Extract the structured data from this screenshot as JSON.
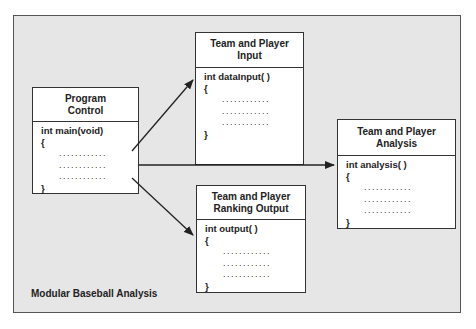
{
  "diagram": {
    "caption": "Modular Baseball Analysis",
    "boxes": {
      "control": {
        "title_line1": "Program",
        "title_line2": "Control",
        "signature": "int main(void)",
        "open_brace": "{",
        "dots": [
          "............",
          "............",
          "............"
        ],
        "close_brace": "}"
      },
      "input": {
        "title_line1": "Team and Player",
        "title_line2": "Input",
        "signature": "int dataInput( )",
        "open_brace": "{",
        "dots": [
          "............",
          "............",
          "............"
        ],
        "close_brace": "}"
      },
      "ranking": {
        "title_line1": "Team and Player",
        "title_line2": "Ranking Output",
        "signature": "int output( )",
        "open_brace": "{",
        "dots": [
          "............",
          "............",
          "............"
        ],
        "close_brace": "}"
      },
      "analysis": {
        "title_line1": "Team and Player",
        "title_line2": "Analysis",
        "signature": "int analysis( )",
        "open_brace": "{",
        "dots": [
          "............",
          "............",
          "............"
        ],
        "close_brace": "}"
      }
    },
    "arrows": [
      {
        "from": "control",
        "to": "input"
      },
      {
        "from": "control",
        "to": "analysis"
      },
      {
        "from": "control",
        "to": "ranking"
      }
    ],
    "colors": {
      "background": "#e6e6e6",
      "box": "#ffffff",
      "line": "#222222"
    }
  }
}
